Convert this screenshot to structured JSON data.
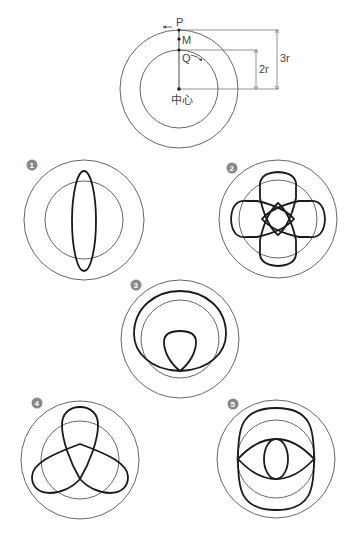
{
  "main_diagram": {
    "labels": {
      "P": "P",
      "M": "M",
      "Q": "Q",
      "center": "中心",
      "dim_inner": "2r",
      "dim_outer": "3r"
    },
    "colors": {
      "line": "#555555",
      "curve": "#1a1a1a",
      "badge": "#888888"
    }
  },
  "patterns": [
    {
      "number": "1",
      "badge": "❶",
      "description": "elongated vertical ellipse"
    },
    {
      "number": "2",
      "badge": "❷",
      "description": "four-lobed rosette"
    },
    {
      "number": "3",
      "badge": "❸",
      "description": "cardioid-like curve with inner loop"
    },
    {
      "number": "4",
      "badge": "❹",
      "description": "three-lobed trefoil"
    },
    {
      "number": "5",
      "badge": "❺",
      "description": "two-lobed curve with inner loop"
    }
  ]
}
